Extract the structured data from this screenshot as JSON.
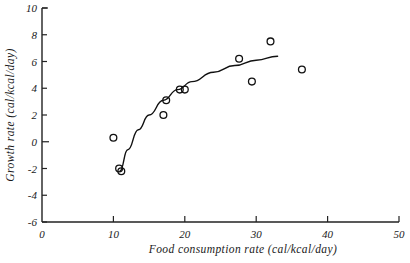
{
  "chart_data": {
    "type": "scatter",
    "title": "",
    "xlabel": "Food consumption rate (cal/kcal/day)",
    "ylabel": "Growth rate (cal/kcal/day)",
    "xlim": [
      0,
      50
    ],
    "ylim": [
      -6,
      10
    ],
    "xticks": [
      0,
      10,
      20,
      30,
      40,
      50
    ],
    "xtick_labels": [
      "0",
      "10",
      "20",
      "30",
      "40",
      "50"
    ],
    "yticks": [
      -6,
      -4,
      -2,
      0,
      2,
      4,
      6,
      8,
      10
    ],
    "ytick_labels": [
      "-6",
      "-4",
      "-2",
      "0",
      "2",
      "4",
      "6",
      "8",
      "10"
    ],
    "grid": false,
    "legend": "none",
    "marker": "open-circle",
    "points": [
      {
        "x": 10.0,
        "y": 0.3
      },
      {
        "x": 10.8,
        "y": -2.0
      },
      {
        "x": 11.1,
        "y": -2.2
      },
      {
        "x": 17.0,
        "y": 2.0
      },
      {
        "x": 17.4,
        "y": 3.1
      },
      {
        "x": 19.3,
        "y": 3.9
      },
      {
        "x": 20.0,
        "y": 3.9
      },
      {
        "x": 27.6,
        "y": 6.2
      },
      {
        "x": 29.4,
        "y": 4.5
      },
      {
        "x": 32.0,
        "y": 7.5
      },
      {
        "x": 36.4,
        "y": 5.4
      }
    ],
    "fit_curve": {
      "description": "smooth saturating trend line",
      "points": [
        {
          "x": 10.9,
          "y": -2.2
        },
        {
          "x": 12.0,
          "y": -0.6
        },
        {
          "x": 13.5,
          "y": 0.9
        },
        {
          "x": 15.0,
          "y": 2.0
        },
        {
          "x": 17.0,
          "y": 3.1
        },
        {
          "x": 19.0,
          "y": 3.9
        },
        {
          "x": 21.0,
          "y": 4.5
        },
        {
          "x": 24.0,
          "y": 5.2
        },
        {
          "x": 27.0,
          "y": 5.7
        },
        {
          "x": 30.0,
          "y": 6.1
        },
        {
          "x": 33.0,
          "y": 6.4
        }
      ]
    }
  },
  "axes": {
    "x_title": "Food consumption rate (cal/kcal/day)",
    "y_title": "Growth rate (cal/kcal/day)"
  }
}
